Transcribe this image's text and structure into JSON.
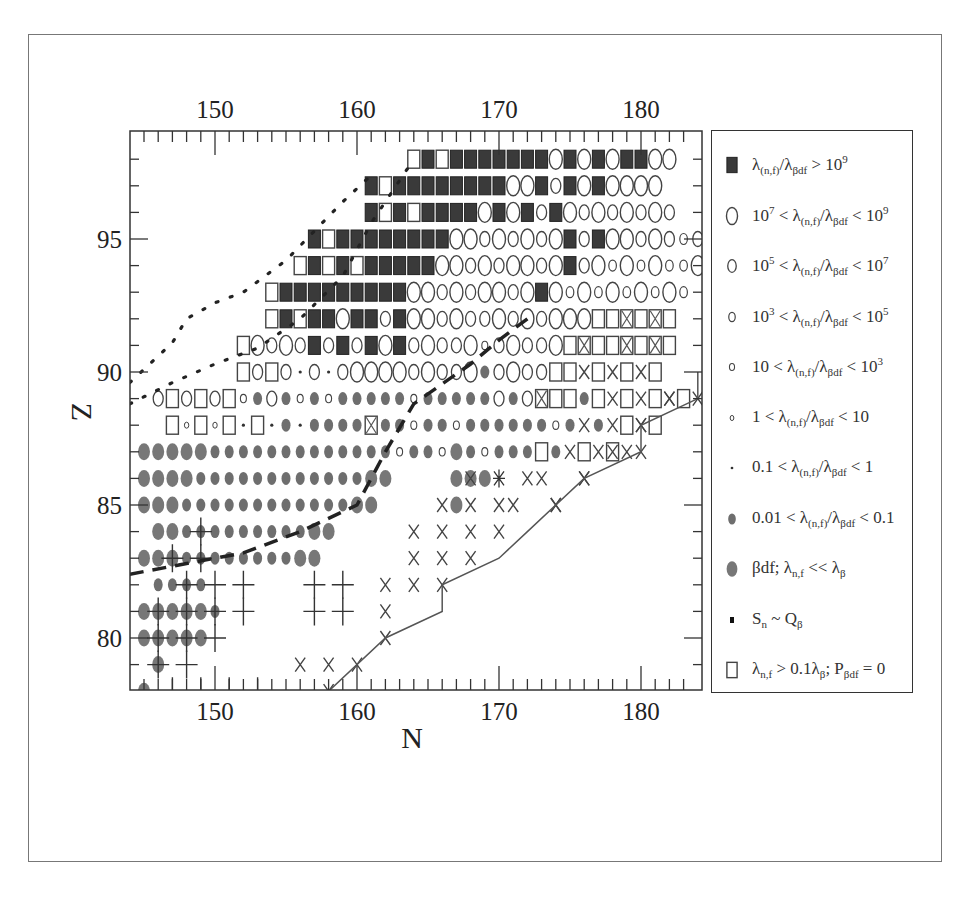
{
  "chart_data": {
    "type": "scatter",
    "title": "",
    "xlabel": "N",
    "ylabel": "Z",
    "x_ticks_bottom": [
      "150",
      "160",
      "170",
      "180"
    ],
    "x_ticks_top": [
      "150",
      "160",
      "170",
      "180"
    ],
    "y_ticks": [
      "80",
      "85",
      "90",
      "95"
    ],
    "xlim": [
      144,
      184
    ],
    "ylim": [
      78,
      99
    ],
    "grid": false,
    "legend_position": "right",
    "legend": [
      {
        "symbol": "filled-square",
        "label": "λ(n,f)/λβdf > 10^9"
      },
      {
        "symbol": "circle-large",
        "label": "10^7 < λ(n,f)/λβdf < 10^9"
      },
      {
        "symbol": "circle-medium",
        "label": "10^5 < λ(n,f)/λβdf < 10^7"
      },
      {
        "symbol": "circle-small",
        "label": "10^3 < λ(n,f)/λβdf < 10^5"
      },
      {
        "symbol": "circle-tiny",
        "label": "10 < λ(n,f)/λβdf < 10^3"
      },
      {
        "symbol": "circle-mini",
        "label": "1 < λ(n,f)/λβdf < 10"
      },
      {
        "symbol": "dot",
        "label": "0.1 < λ(n,f)/λβdf < 1"
      },
      {
        "symbol": "gray-dot",
        "label": "0.01 < λ(n,f)/λβdf < 0.1"
      },
      {
        "symbol": "gray-ellipse",
        "label": "βdf; λn,f << λβ"
      },
      {
        "symbol": "black-small-square",
        "label": "Sn ~ Qβ"
      },
      {
        "symbol": "open-square",
        "label": "λn,f > 0.1λβ; Pβdf = 0"
      }
    ],
    "symbol_codes": {
      "F": "filled-square (>1e9)",
      "L": "circle-large (1e7-1e9)",
      "M": "circle-medium (1e5-1e7)",
      "S": "circle-small (1e3-1e5)",
      "T": "circle-tiny (10-1e3)",
      "m": "circle-mini (1-10)",
      "d": "dot (0.1-1)",
      "g": "gray-dot (0.01-0.1)",
      "B": "gray-ellipse (βdf)",
      "Q": "open-square",
      "X": "x-mark",
      "+": "crosshair plus",
      "q": "open-square with cross",
      "*": "asterisk"
    },
    "rows": [
      {
        "Z": 98,
        "start": 164,
        "cells": "QFQFFFFFFFLFLFLFFLL"
      },
      {
        "Z": 97,
        "start": 161,
        "cells": "FQFFFFFFFFLLFMFLFLLLL"
      },
      {
        "Z": 96,
        "start": 161,
        "cells": "FQFQFFFFLFLFMFLMLMLMLM"
      },
      {
        "Z": 95,
        "start": 157,
        "cells": "FQFFFFFFFFLLMLMLMLFMFLLMLMSMML"
      },
      {
        "Z": 94,
        "start": 156,
        "cells": "QFQFQFFFFFLLMLMLLMLFMLSLSLSSL"
      },
      {
        "Z": 93,
        "start": 154,
        "cells": "QFFFFFFFFFLLMLMLLMLFLSLSLSLSLS"
      },
      {
        "Z": 92,
        "start": 154,
        "cells": "QFQFFLFFMFLLMLMMLMLMLLLQQqQqQ"
      },
      {
        "Z": 91,
        "start": 152,
        "cells": "QLMLMFMFMFLFMLMMLTMLMMLQqQQqQqQ"
      },
      {
        "Z": 90,
        "start": 152,
        "cells": "QMQMdMdMLLLLMLMMLgMLMMQQXQXQXQ"
      },
      {
        "Z": 89,
        "start": 146,
        "cells": "MQMQMQTgMgTgTgggggTgggggMgMqQQgQXQXQXQ"
      },
      {
        "Z": 88,
        "start": 147,
        "cells": "QmQmQdQdgdggggqggTggTggggggTgXgXQXQ"
      },
      {
        "Z": 87,
        "start": 145,
        "cells": "BBBBBgggggggggggggTggTBgTgggQgXQXQXX"
      },
      {
        "Z": 86,
        "start": 145,
        "cells": "BBBBggggggggggggBB    BBB*  X  X"
      },
      {
        "Z": 85,
        "start": 145,
        "cells": "BBBggggggggggggBB     BX  X  X"
      },
      {
        "Z": 84,
        "start": 146,
        "cells": "BBgggggggggBB"
      },
      {
        "Z": 83,
        "start": 145,
        "cells": "BBBggggggggBB"
      },
      {
        "Z": 82,
        "start": 146,
        "cells": "gggg"
      },
      {
        "Z": 81,
        "start": 145,
        "cells": "BBBBBg"
      },
      {
        "Z": 80,
        "start": 145,
        "cells": "BBBBB"
      },
      {
        "Z": 79,
        "start": 146,
        "cells": "B"
      },
      {
        "Z": 78,
        "start": 145,
        "cells": "B"
      }
    ],
    "x_marks": [
      [
        166,
        85
      ],
      [
        170,
        85
      ],
      [
        174,
        85
      ],
      [
        168,
        86
      ],
      [
        172,
        86
      ],
      [
        176,
        86
      ],
      [
        178,
        87
      ],
      [
        180,
        88
      ],
      [
        182,
        89
      ],
      [
        184,
        89
      ],
      [
        164,
        84
      ],
      [
        166,
        84
      ],
      [
        168,
        84
      ],
      [
        170,
        84
      ],
      [
        164,
        83
      ],
      [
        166,
        83
      ],
      [
        168,
        83
      ],
      [
        162,
        82
      ],
      [
        164,
        82
      ],
      [
        166,
        82
      ],
      [
        162,
        81
      ],
      [
        156,
        79
      ],
      [
        158,
        79
      ],
      [
        160,
        79
      ],
      [
        158,
        78
      ],
      [
        162,
        80
      ]
    ],
    "plus_marks": [
      [
        149,
        84
      ],
      [
        149,
        83
      ],
      [
        147,
        83
      ],
      [
        148,
        82
      ],
      [
        150,
        82
      ],
      [
        152,
        82
      ],
      [
        157,
        82
      ],
      [
        159,
        82
      ],
      [
        146,
        81
      ],
      [
        148,
        81
      ],
      [
        150,
        81
      ],
      [
        152,
        81
      ],
      [
        157,
        81
      ],
      [
        159,
        81
      ],
      [
        146,
        80
      ],
      [
        148,
        80
      ],
      [
        150,
        80
      ],
      [
        146,
        79
      ],
      [
        148,
        79
      ],
      [
        147,
        78
      ],
      [
        149,
        78
      ],
      [
        151,
        78
      ],
      [
        153,
        78
      ]
    ],
    "solid_line": {
      "label": "boundary",
      "points": [
        [
          158,
          78
        ],
        [
          162,
          80
        ],
        [
          166,
          81
        ],
        [
          166,
          82
        ],
        [
          170,
          83
        ],
        [
          172,
          84
        ],
        [
          176,
          86
        ],
        [
          180,
          87
        ],
        [
          180,
          88
        ],
        [
          184,
          89
        ],
        [
          184,
          90
        ]
      ]
    },
    "dashed_line": {
      "label": "dashed boundary",
      "points": [
        [
          144,
          82.4
        ],
        [
          148,
          82.8
        ],
        [
          152,
          83.2
        ],
        [
          156,
          84
        ],
        [
          160,
          85
        ],
        [
          162,
          87
        ],
        [
          164,
          88.8
        ],
        [
          168,
          90.3
        ],
        [
          170,
          91.2
        ],
        [
          172,
          92
        ]
      ]
    },
    "dotted_lines": [
      {
        "points": [
          [
            144,
            88.8
          ],
          [
            147,
            89.6
          ],
          [
            150,
            90.3
          ],
          [
            153,
            90.9
          ],
          [
            156,
            92
          ],
          [
            159,
            93.6
          ],
          [
            161,
            95.6
          ],
          [
            163,
            97.2
          ],
          [
            164,
            98
          ]
        ]
      },
      {
        "points": [
          [
            144,
            89.6
          ],
          [
            146,
            90.6
          ],
          [
            147,
            91.1
          ],
          [
            148,
            92
          ],
          [
            150,
            92.6
          ],
          [
            152,
            93
          ],
          [
            155,
            94.2
          ],
          [
            157,
            95.3
          ],
          [
            159,
            96.4
          ],
          [
            161,
            97.4
          ]
        ]
      }
    ]
  }
}
